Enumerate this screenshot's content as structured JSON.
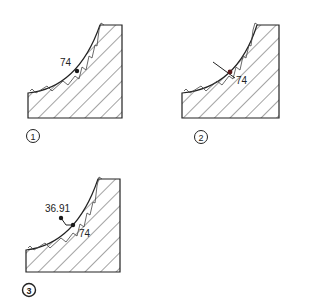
{
  "diagram": {
    "panels": [
      {
        "id": "1",
        "step_label": "1",
        "dimension_label": "74"
      },
      {
        "id": "2",
        "step_label": "2",
        "dimension_label": "74"
      },
      {
        "id": "3",
        "step_label": "3",
        "dimension_label": "74",
        "secondary_label": "36.91"
      }
    ],
    "colors": {
      "stroke": "#222222",
      "point": "#1a1a1a",
      "point_red": "#5a1a1a",
      "background": "#ffffff"
    }
  }
}
